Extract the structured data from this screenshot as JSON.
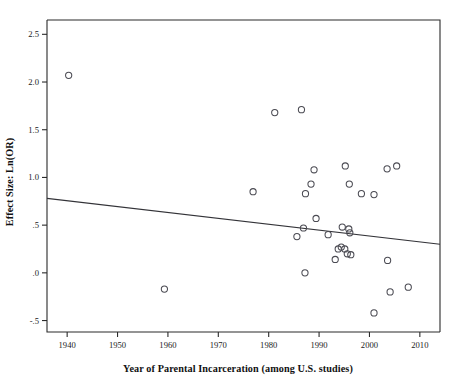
{
  "chart_data": {
    "type": "scatter",
    "title": "",
    "xlabel": "Year of Parental Incarceration (among U.S. studies)",
    "ylabel": "Effect Size: Ln(OR)",
    "xlim": [
      1936,
      2014
    ],
    "ylim": [
      -0.62,
      2.65
    ],
    "xticks": [
      1940,
      1950,
      1960,
      1970,
      1980,
      1990,
      2000,
      2010
    ],
    "xticklabels": [
      "1940",
      "1950",
      "1960",
      "1970",
      "1980",
      "1990",
      "2000",
      "2010"
    ],
    "yticks": [
      -0.5,
      0.0,
      0.5,
      1.0,
      1.5,
      2.0,
      2.5
    ],
    "yticklabels": [
      "-.5",
      ".0",
      ".5",
      "1.0",
      "1.5",
      "2.0",
      "2.5"
    ],
    "grid": false,
    "legend": false,
    "marker": "open-circle",
    "marker_color": "#4a4a52",
    "points": [
      {
        "x": 1940.3,
        "y": 2.07
      },
      {
        "x": 1981.2,
        "y": 1.68
      },
      {
        "x": 1986.5,
        "y": 1.71
      },
      {
        "x": 1976.9,
        "y": 0.85
      },
      {
        "x": 1985.6,
        "y": 0.38
      },
      {
        "x": 1986.9,
        "y": 0.47
      },
      {
        "x": 1987.2,
        "y": 0.0
      },
      {
        "x": 1987.3,
        "y": 0.83
      },
      {
        "x": 1988.4,
        "y": 0.93
      },
      {
        "x": 1989.0,
        "y": 1.08
      },
      {
        "x": 1989.4,
        "y": 0.57
      },
      {
        "x": 1991.8,
        "y": 0.4
      },
      {
        "x": 1993.2,
        "y": 0.14
      },
      {
        "x": 1993.8,
        "y": 0.25
      },
      {
        "x": 1994.4,
        "y": 0.27
      },
      {
        "x": 1994.6,
        "y": 0.48
      },
      {
        "x": 1995.1,
        "y": 0.25
      },
      {
        "x": 1995.2,
        "y": 1.12
      },
      {
        "x": 1995.6,
        "y": 0.2
      },
      {
        "x": 1995.9,
        "y": 0.46
      },
      {
        "x": 1996.1,
        "y": 0.42
      },
      {
        "x": 1996.3,
        "y": 0.19
      },
      {
        "x": 1996.0,
        "y": 0.93
      },
      {
        "x": 1998.4,
        "y": 0.83
      },
      {
        "x": 2000.9,
        "y": 0.82
      },
      {
        "x": 2000.9,
        "y": -0.42
      },
      {
        "x": 2003.5,
        "y": 1.09
      },
      {
        "x": 2003.6,
        "y": 0.13
      },
      {
        "x": 2004.1,
        "y": -0.2
      },
      {
        "x": 2005.4,
        "y": 1.12
      },
      {
        "x": 2007.7,
        "y": -0.15
      },
      {
        "x": 1959.3,
        "y": -0.17
      }
    ],
    "trend_line": {
      "x_start": 1936,
      "y_start": 0.78,
      "x_end": 2014,
      "y_end": 0.3
    }
  }
}
